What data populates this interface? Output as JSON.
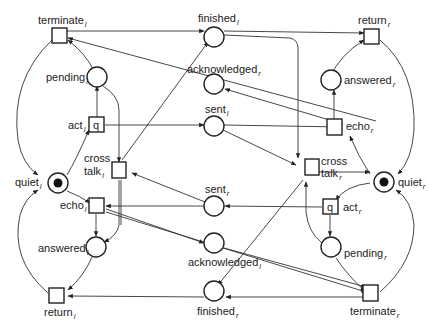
{
  "places": {
    "finished_l": {
      "name": "finished",
      "sub": "l"
    },
    "acknowledged_r": {
      "name": "acknowledged",
      "sub": "r"
    },
    "sent_l": {
      "name": "sent",
      "sub": "l"
    },
    "sent_r": {
      "name": "sent",
      "sub": "r"
    },
    "acknowledged_l": {
      "name": "acknowledged",
      "sub": "l"
    },
    "finished_r": {
      "name": "finished",
      "sub": "r"
    },
    "pending_l": {
      "name": "pending",
      "sub": "l"
    },
    "answered_l": {
      "name": "answered",
      "sub": "l"
    },
    "quiet_l": {
      "name": "quiet",
      "sub": "l"
    },
    "answered_r": {
      "name": "answered",
      "sub": "r"
    },
    "pending_r": {
      "name": "pending",
      "sub": "r"
    },
    "quiet_r": {
      "name": "quiet",
      "sub": "r"
    }
  },
  "transitions": {
    "terminate_l": {
      "name": "terminate",
      "sub": "l"
    },
    "act_l": {
      "name": "act",
      "sub": "l",
      "inner": "q"
    },
    "cross_talk_l": {
      "name1": "cross",
      "name2": "talk",
      "sub": "l"
    },
    "echo_l": {
      "name": "echo",
      "sub": "l"
    },
    "return_l": {
      "name": "return",
      "sub": "l"
    },
    "return_r": {
      "name": "return",
      "sub": "r"
    },
    "echo_r": {
      "name": "echo",
      "sub": "r"
    },
    "cross_talk_r": {
      "name1": "cross",
      "name2": "talk",
      "sub": "r"
    },
    "act_r": {
      "name": "act",
      "sub": "r",
      "inner": "q"
    },
    "terminate_r": {
      "name": "terminate",
      "sub": "r"
    }
  },
  "tokens": [
    "quiet_l",
    "quiet_r"
  ]
}
